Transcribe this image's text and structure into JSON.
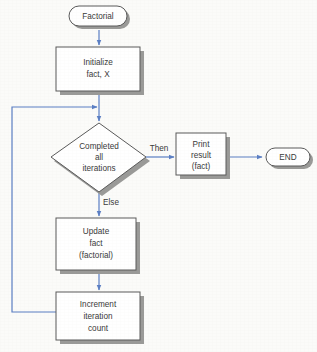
{
  "figure": {
    "type": "flowchart",
    "background_color": "#fbfbf9",
    "connector_color": "#5b7fc4",
    "node_fill": "#ffffff",
    "node_border_color": "#5a5a5a",
    "shadow_color": "#9a9a98",
    "text_color": "#3a3a3a"
  },
  "nodes": {
    "start": {
      "shape": "terminator",
      "label": "Factorial"
    },
    "initialize": {
      "shape": "process",
      "line1": "Initialize",
      "line2": "fact, X"
    },
    "decision": {
      "shape": "decision",
      "line1": "Completed",
      "line2": "all",
      "line3": "iterations"
    },
    "print": {
      "shape": "process",
      "line1": "Print",
      "line2": "result",
      "line3": "(fact)"
    },
    "end": {
      "shape": "terminator",
      "label": "END"
    },
    "update": {
      "shape": "process",
      "line1": "Update",
      "line2": "fact",
      "line3": "(factorial)"
    },
    "increment": {
      "shape": "process",
      "line1": "Increment",
      "line2": "iteration",
      "line3": "count"
    }
  },
  "edge_labels": {
    "then": "Then",
    "else": "Else"
  }
}
